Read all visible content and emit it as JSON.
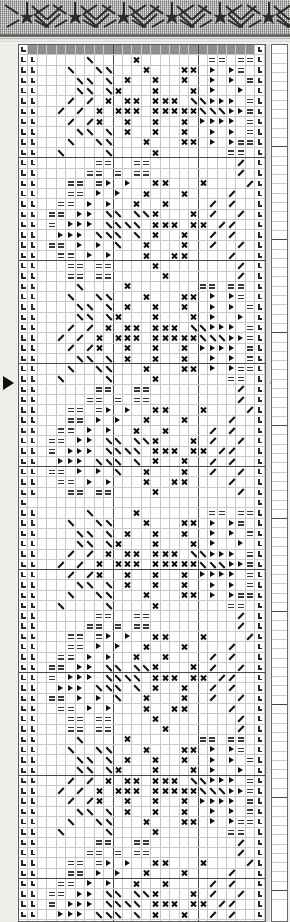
{
  "document": {
    "kind": "knitting-lace-chart",
    "page_background": "#f2f2f0",
    "ink_color": "#111111",
    "grid_line_color": "#c9c9c9",
    "major_line_color": "#4a4a4a",
    "header_band_color": "#8f8f8f"
  },
  "ornament": {
    "name": "woven-border-ornament",
    "motif_count": 6,
    "chevron_count": 6,
    "rule_color": "#3a3a38"
  },
  "chart": {
    "columns": 26,
    "rows": 92,
    "cell_px": 9.3,
    "major_column_interval": 9,
    "major_row_interval": 10,
    "header_row_index": 0,
    "legend": [
      {
        "symbol": "x",
        "name": "cross-stitch-symbol",
        "glyph": "X",
        "meaning": "knit through back loop"
      },
      {
        "symbol": "bs",
        "name": "left-decrease-symbol",
        "glyph": "\\",
        "meaning": "k2tog left-leaning"
      },
      {
        "symbol": "fs",
        "name": "right-decrease-symbol",
        "glyph": "/",
        "meaning": "ssk right-leaning"
      },
      {
        "symbol": "tr",
        "name": "triangle-symbol",
        "glyph": "▶",
        "meaning": "yarn over / direction"
      },
      {
        "symbol": "eq",
        "name": "double-dash-symbol",
        "glyph": "=",
        "meaning": "purl two rows"
      },
      {
        "symbol": "cn",
        "name": "selvedge-corner-symbol",
        "glyph": "⌐",
        "meaning": "edge stitch"
      }
    ],
    "repeat_markers": {
      "left": {
        "name": "repeat-start-marker",
        "glyph": "▶",
        "row": 36
      },
      "right": {
        "name": "repeat-end-marker",
        "glyph": "◀",
        "row": 36
      }
    },
    "edge_columns": {
      "left_index": 0,
      "right_index": 25,
      "symbol": "cn"
    },
    "rows_data": [
      "..........................",
      ".C.....B....X.......==.==C",
      ".C...B..BB...X...XX.T.T=.=C",
      ".C....BB.B.X..X..X..T.T.==C",
      ".C....BB.BX...X...X.T..T.=C",
      ".C...N.N.X.XX.XXX.BBTTT.==C",
      ".C..N.N.X.XXX.XXXXXBBBTT==C",
      ".C...N.NX..X..X..X.TTTT.==C",
      ".C....BB.B.X..X..X..T.T.==C",
      ".C...B..BB...X...XX.T.T==.C",
      ".C..B....B....X.......==..C",
      ".C......==..==.........N..C",
      ".C.....==.=.==.........N..C",
      ".C...==.=T.T..XX...X....N.C",
      ".C...==.T.T..X...X....N...C",
      ".C..==.T.T..X..X....N.N...C",
      ".C.==.TT.BB.BBX...X.N..N..C",
      ".C.=.TTT.BBBB.XXX.XX.NN...C",
      ".C..TTT.BBB.B.X..X..N.N...C",
      ".C.==.T.T.B..X...X..N..N..C",
      ".C..==.T.T...X..XX....N...C",
      ".C...==.==....X........N..C",
      ".C...==.==.....X.......N..C",
      ".C....B....X.......==.==..C",
      ".C...B..BB...X...XX.T.T=.=C",
      ".C....BB.B.X..X..X..T.T.==C",
      ".C....BB.BX...X...X.T..T.=C",
      ".C...N.N.X.XX.XXX.BBTTT.==C",
      ".C..N.N.X.XXX.XXXXXBBBTT==C",
      ".C...N.NX..X..X..X.TTTT.==C",
      ".C....BB.B.X..X..X..T.T.==C",
      ".C...B..BB...X...XX.T.T==.C",
      ".C..B....B....X.......==..C",
      ".C......==..==.........N..C",
      ".C.....==.=.==.........N..C",
      ".C...==.=T.T..XX...X....N.C",
      ".C...==.T.T..X...X....N...C",
      ".C..==.T.T..X..X....N.N...C",
      ".C.==.TT.BB.BBX...X.N..N..C",
      ".C.=.TTT.BBBB.XXX.XX.NN...C",
      ".C..TTT.BBB.B.X..X..N.N...C",
      ".C.==.T.T.B..X...X..N..N..C",
      ".C..==.T.T...X..XX....N...C",
      ".C...==.==....X........N..C"
    ]
  },
  "side_chart": {
    "name": "adjacent-chart-strip",
    "columns": 1,
    "rows": 92
  }
}
